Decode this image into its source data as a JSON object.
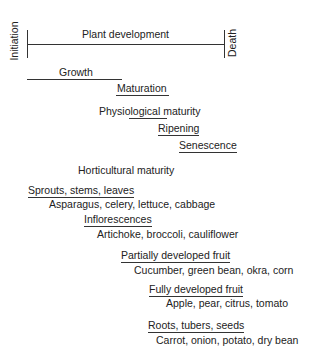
{
  "timeline": {
    "title": "Plant development",
    "start_label": "Initiation",
    "end_label": "Death"
  },
  "stages": {
    "growth": "Growth",
    "maturation": "Maturation",
    "physiological_maturity": "Physiological maturity",
    "ripening": "Ripening",
    "senescence": "Senescence",
    "horticultural_maturity": "Horticultural maturity"
  },
  "categories": [
    {
      "label": "Sprouts, stems, leaves",
      "examples": "Asparagus, celery, lettuce, cabbage"
    },
    {
      "label": "Inflorescences",
      "examples": "Artichoke, broccoli, cauliflower"
    },
    {
      "label": "Partially developed fruit",
      "examples": "Cucumber, green bean, okra, corn"
    },
    {
      "label": "Fully developed fruit",
      "examples": "Apple, pear, citrus, tomato"
    },
    {
      "label": "Roots, tubers, seeds",
      "examples": "Carrot, onion, potato, dry bean"
    }
  ]
}
